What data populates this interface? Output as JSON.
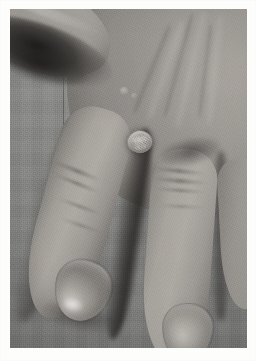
{
  "document": {
    "type": "clinical-photograph",
    "title": "Clinical photograph of hand",
    "caption": ""
  },
  "photo": {
    "subject": "dorsal surface of a human hand",
    "orientation": "portrait",
    "border_style": "white photographic paper margin",
    "colors": {
      "paper_border": "#fdfdfc",
      "background_cloth": "#939391",
      "skin_midtone": "#b2aea8",
      "skin_highlight": "#d4d0ca",
      "skin_shadow": "#716e6a",
      "deep_shadow": "#1c1a19",
      "nail_highlight": "#e9e7e2",
      "lesion_tone": "#d8d4ce"
    },
    "regions": [
      {
        "name": "background-cloth",
        "label": "Gray woven fabric backdrop"
      },
      {
        "name": "thumb",
        "label": "Thumb, upper left"
      },
      {
        "name": "web-space",
        "label": "First web space in shadow"
      },
      {
        "name": "hand-dorsum",
        "label": "Dorsum of hand, upper right"
      },
      {
        "name": "index-finger",
        "label": "Index finger extending to lower left"
      },
      {
        "name": "middle-finger",
        "label": "Middle finger extending downward"
      },
      {
        "name": "ring-finger",
        "label": "Ring finger partially visible at right edge"
      },
      {
        "name": "index-nail",
        "label": "Index fingernail with specular highlight"
      },
      {
        "name": "middle-nail",
        "label": "Middle fingernail"
      },
      {
        "name": "lesion",
        "label": "Raised pale papule with verrucous surface"
      }
    ],
    "lesion": {
      "name": "cutaneous-lesion",
      "description": "Solitary raised skin-colored papule with rough surface",
      "location": "dorsum of hand over index finger metacarpophalangeal region",
      "approx_position_px": "x 136, y 140",
      "approx_size_px": "24 x 22"
    }
  }
}
